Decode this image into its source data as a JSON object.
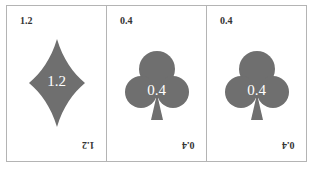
{
  "colors": {
    "suit_fill": "#6f6f6f",
    "card_border": "#b4b4b4",
    "corner_text": "#333333",
    "pip_text": "#ffffff"
  },
  "cards": [
    {
      "suit": "diamond",
      "suit_icon": "diamond-icon",
      "value": "1.2",
      "corner_top": "1.2",
      "corner_bottom": "1.2"
    },
    {
      "suit": "club",
      "suit_icon": "club-icon",
      "value": "0.4",
      "corner_top": "0.4",
      "corner_bottom": "0.4"
    },
    {
      "suit": "club",
      "suit_icon": "club-icon",
      "value": "0.4",
      "corner_top": "0.4",
      "corner_bottom": "0.4"
    }
  ]
}
